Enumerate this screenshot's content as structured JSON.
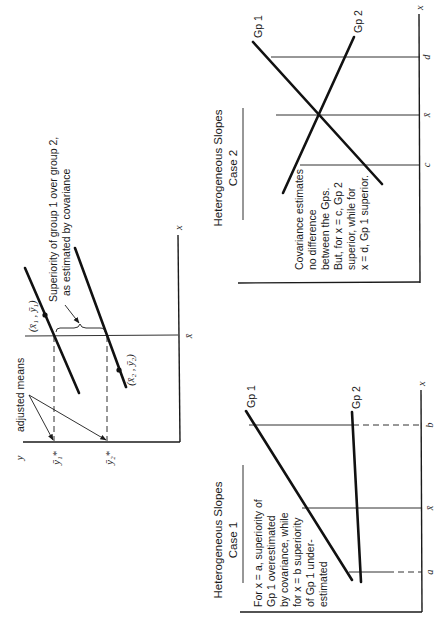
{
  "diagram_adjusted_means": {
    "axis_y_label": "y",
    "axis_x_label": "x",
    "xbar_label": "x̄",
    "adjusted_means_label": "adjusted means",
    "y1_adj_label": "ȳ₁*",
    "y2_adj_label": "ȳ₂*",
    "point1_label": "(x̄₁ , ȳ₁)",
    "point2_label": "(x̄₂ , ȳ₂)",
    "superiority_line1": "Superiority of group 1 over group 2,",
    "superiority_line2": "as estimated by covariance"
  },
  "diagram_case1": {
    "title_line1": "Heterogeneous Slopes",
    "title_line2": "Case 1",
    "axis_x_label": "x",
    "tick_a": "a",
    "tick_xbar": "x̄",
    "tick_b": "b",
    "gp1_label": "Gp 1",
    "gp2_label": "Gp 2",
    "note_lines": [
      "For x  =  a, superiority of",
      "Gp 1 overestimated",
      "by covariance, while",
      "for x  =  b superiority",
      "of Gp 1 under-",
      "estimated"
    ]
  },
  "diagram_case2": {
    "title_line1": "Heterogeneous Slopes",
    "title_line2": "Case 2",
    "axis_x_label": "x",
    "tick_c": "c",
    "tick_xbar": "x̄",
    "tick_d": "d",
    "gp1_label": "Gp 1",
    "gp2_label": "Gp 2",
    "note_lines": [
      "Covariance estimates",
      "no difference",
      "between the Gps.",
      "But, for x  =  c, Gp 2",
      "superior, while for",
      "x  =  d, Gp 1 superior."
    ]
  }
}
